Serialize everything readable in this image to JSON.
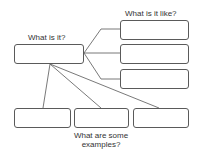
{
  "diagram": {
    "type": "graphic-organizer",
    "labels": {
      "what_is_it": "What is it?",
      "what_is_it_like": "What is it like?",
      "examples_line1": "What are some",
      "examples_line2": "examples?"
    },
    "nodes": [
      {
        "id": "center",
        "role": "What is it?",
        "text": ""
      },
      {
        "id": "like-1",
        "role": "What is it like?",
        "text": ""
      },
      {
        "id": "like-2",
        "role": "What is it like?",
        "text": ""
      },
      {
        "id": "like-3",
        "role": "What is it like?",
        "text": ""
      },
      {
        "id": "example-1",
        "role": "What are some examples?",
        "text": ""
      },
      {
        "id": "example-2",
        "role": "What are some examples?",
        "text": ""
      },
      {
        "id": "example-3",
        "role": "What are some examples?",
        "text": ""
      }
    ],
    "edges": [
      [
        "center",
        "like-1"
      ],
      [
        "center",
        "like-2"
      ],
      [
        "center",
        "like-3"
      ],
      [
        "center",
        "example-1"
      ],
      [
        "center",
        "example-2"
      ],
      [
        "center",
        "example-3"
      ]
    ],
    "colors": {
      "stroke": "#5a5a5a",
      "text": "#333333",
      "background": "#ffffff"
    }
  }
}
